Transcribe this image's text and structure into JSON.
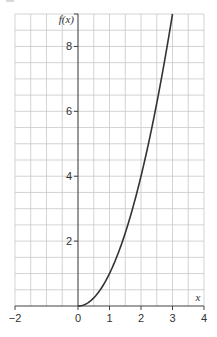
{
  "chart_data": {
    "type": "line",
    "title": "",
    "xlabel": "x",
    "ylabel": "f(x)",
    "xlim": [
      -2,
      4
    ],
    "ylim": [
      0,
      9
    ],
    "grid": true,
    "grid_step": 0.5,
    "x_ticks": [
      -2,
      0,
      1,
      2,
      3,
      4
    ],
    "x_tick_labels": [
      "−2",
      "0",
      "1",
      "2",
      "3",
      "4"
    ],
    "y_ticks": [
      2,
      4,
      6,
      8
    ],
    "y_tick_labels": [
      "2",
      "4",
      "6",
      "8"
    ],
    "series": [
      {
        "name": "f(x)",
        "function": "x^2",
        "x": [
          0,
          0.25,
          0.5,
          0.75,
          1,
          1.25,
          1.5,
          1.75,
          2,
          2.25,
          2.5,
          2.75,
          3
        ],
        "values": [
          0,
          0.06,
          0.25,
          0.56,
          1,
          1.56,
          2.25,
          3.06,
          4,
          5.06,
          6.25,
          7.56,
          9
        ]
      }
    ],
    "legend": null,
    "colors": {
      "curve": "#333333",
      "axis": "#444444",
      "grid": "#c8c8c8"
    }
  }
}
